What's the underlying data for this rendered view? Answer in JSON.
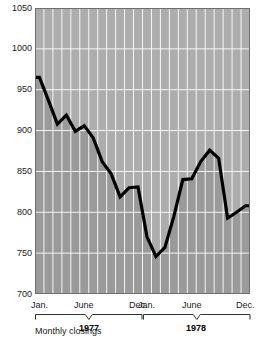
{
  "chart_data": {
    "type": "line",
    "title": "",
    "subtitle": "",
    "xlabel": "",
    "ylabel": "",
    "footnote": "Monthly closings",
    "ylim": [
      700,
      1050
    ],
    "y_ticks": [
      700,
      750,
      800,
      850,
      900,
      950,
      1000,
      1050
    ],
    "y_tick_labels": [
      "700",
      "750",
      "800",
      "850",
      "900",
      "950",
      "1000",
      "1050"
    ],
    "grid": true,
    "grid_color": "#ffffff",
    "legend": "none",
    "line_color": "#000000",
    "fill_below_color": "#9a9a9a",
    "fill_above_color": "#adadad",
    "x_groups": [
      {
        "year": "1977",
        "tick_labels": [
          "Jan.",
          "June",
          "Dec."
        ],
        "tick_months": [
          1,
          6,
          12
        ]
      },
      {
        "year": "1978",
        "tick_labels": [
          "Jan.",
          "June",
          "Dec."
        ],
        "tick_months": [
          1,
          6,
          12
        ]
      }
    ],
    "x": [
      "1977-01",
      "1977-02",
      "1977-03",
      "1977-04",
      "1977-05",
      "1977-06",
      "1977-07",
      "1977-08",
      "1977-09",
      "1977-10",
      "1977-11",
      "1977-12",
      "1978-01",
      "1978-02",
      "1978-03",
      "1978-04",
      "1978-05",
      "1978-06",
      "1978-07",
      "1978-08",
      "1978-09",
      "1978-10",
      "1978-11",
      "1978-12"
    ],
    "categories": [
      "Jan. 1977",
      "Feb. 1977",
      "Mar. 1977",
      "Apr. 1977",
      "May 1977",
      "June 1977",
      "July 1977",
      "Aug. 1977",
      "Sept. 1977",
      "Oct. 1977",
      "Nov. 1977",
      "Dec. 1977",
      "Jan. 1978",
      "Feb. 1978",
      "Mar. 1978",
      "Apr. 1978",
      "May 1978",
      "June 1978",
      "July 1978",
      "Aug. 1978",
      "Sept. 1978",
      "Oct. 1978",
      "Nov. 1978",
      "Dec. 1978"
    ],
    "values": [
      965,
      937,
      908,
      919,
      899,
      906,
      891,
      862,
      847,
      819,
      830,
      831,
      770,
      746,
      757,
      795,
      840,
      841,
      862,
      876,
      866,
      793,
      800,
      808
    ],
    "series": [
      {
        "name": "Monthly closings",
        "values": [
          965,
          937,
          908,
          919,
          899,
          906,
          891,
          862,
          847,
          819,
          830,
          831,
          770,
          746,
          757,
          795,
          840,
          841,
          862,
          876,
          866,
          793,
          800,
          808
        ]
      }
    ]
  }
}
